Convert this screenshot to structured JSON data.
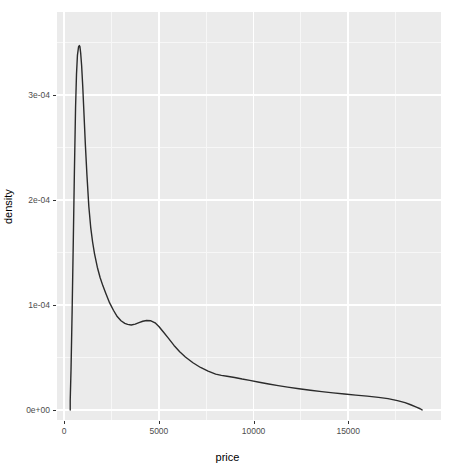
{
  "chart_data": {
    "type": "line",
    "title": "",
    "subtitle": "",
    "xlabel": "price",
    "ylabel": "density",
    "xlim": [
      -380,
      19900
    ],
    "ylim": [
      -9.5e-06,
      0.000379
    ],
    "grid": true,
    "legend": null,
    "x_ticks": [
      {
        "value": 0,
        "label": "0"
      },
      {
        "value": 5000,
        "label": "5000"
      },
      {
        "value": 10000,
        "label": "10000"
      },
      {
        "value": 15000,
        "label": "15000"
      }
    ],
    "y_ticks": [
      {
        "value": 0,
        "label": "0e+00"
      },
      {
        "value": 0.0001,
        "label": "1e-04"
      },
      {
        "value": 0.0002,
        "label": "2e-04"
      },
      {
        "value": 0.0003,
        "label": "3e-04"
      }
    ],
    "x_minor_ticks": [
      2500,
      7500,
      12500,
      17500
    ],
    "y_minor_ticks": [
      5e-05,
      0.00015,
      0.00025,
      0.00035
    ],
    "series": [
      {
        "name": "density",
        "color": "#2b2b2b",
        "line_width": 1.4,
        "x": [
          318,
          318,
          360,
          420,
          480,
          540,
          600,
          650,
          700,
          760,
          800,
          830,
          870,
          920,
          980,
          1050,
          1120,
          1200,
          1300,
          1400,
          1500,
          1600,
          1750,
          1900,
          2050,
          2200,
          2400,
          2600,
          2800,
          3000,
          3200,
          3350,
          3540,
          3750,
          3950,
          4150,
          4350,
          4580,
          4800,
          5000,
          5250,
          5500,
          5800,
          6100,
          6400,
          6800,
          7200,
          7600,
          8000,
          8300,
          8600,
          9000,
          9400,
          9800,
          10300,
          10800,
          11300,
          11800,
          12400,
          13000,
          13600,
          14200,
          14800,
          15400,
          16000,
          16600,
          17100,
          17600,
          18000,
          18300,
          18600,
          18800,
          18900,
          18900
        ],
        "y": [
          0.0,
          9e-06,
          3.8e-05,
          9.5e-05,
          0.00016,
          0.000228,
          0.000288,
          0.00032,
          0.000338,
          0.000346,
          0.000347,
          0.000346,
          0.00034,
          0.000328,
          0.000308,
          0.00028,
          0.000252,
          0.000224,
          0.000194,
          0.000174,
          0.00016,
          0.000149,
          0.000136,
          0.000126,
          0.000118,
          0.000111,
          0.000102,
          9.5e-05,
          8.9e-05,
          8.5e-05,
          8.25e-05,
          8.15e-05,
          8.1e-05,
          8.18e-05,
          8.32e-05,
          8.45e-05,
          8.52e-05,
          8.5e-05,
          8.3e-05,
          7.95e-05,
          7.4e-05,
          6.85e-05,
          6.15e-05,
          5.55e-05,
          5.05e-05,
          4.5e-05,
          4.05e-05,
          3.7e-05,
          3.42e-05,
          3.3e-05,
          3.22e-05,
          3.1e-05,
          2.95e-05,
          2.82e-05,
          2.65e-05,
          2.48e-05,
          2.32e-05,
          2.18e-05,
          2.02e-05,
          1.88e-05,
          1.75e-05,
          1.63e-05,
          1.52e-05,
          1.42e-05,
          1.32e-05,
          1.2e-05,
          1.08e-05,
          9e-06,
          7e-06,
          5e-06,
          2.8e-06,
          1.2e-06,
          2e-07,
          0.0
        ]
      }
    ],
    "annotations": [],
    "style": {
      "panel_background": "#ebebeb",
      "grid_major_color": "#ffffff",
      "grid_minor_color": "#f7f7f7",
      "plot_background": "#ffffff",
      "tick_label_color": "#4d4d4d",
      "axis_title_color": "#000000"
    }
  }
}
